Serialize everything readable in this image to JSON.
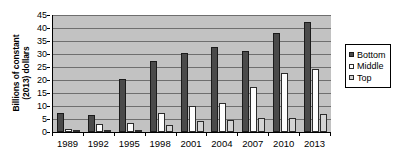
{
  "chart_data": {
    "type": "bar",
    "title": "",
    "subtitle": "",
    "xlabel": "",
    "ylabel": "Billions of constant (2013) dollars",
    "ylabel_lines": [
      "Billions of constant",
      "(2013) dollars"
    ],
    "categories": [
      "1989",
      "1992",
      "1995",
      "1998",
      "2001",
      "2004",
      "2007",
      "2010",
      "2013"
    ],
    "series": [
      {
        "name": "Bottom",
        "color": "#4a4a4a",
        "values": [
          7.0,
          6.2,
          20.2,
          27.2,
          30.1,
          32.4,
          30.8,
          38.0,
          42.0
        ]
      },
      {
        "name": "Middle",
        "color": "#ffffff",
        "values": [
          1.1,
          3.0,
          3.4,
          7.1,
          10.0,
          11.0,
          17.1,
          22.5,
          24.1
        ]
      },
      {
        "name": "Top",
        "color": "#d4d4d4",
        "values": [
          0.2,
          0.2,
          0.2,
          2.4,
          3.9,
          4.3,
          5.2,
          5.3,
          6.9
        ]
      }
    ],
    "ylim": [
      0,
      45
    ],
    "ytick_step": 5,
    "yticks": [
      "0",
      "5",
      "10",
      "15",
      "20",
      "25",
      "30",
      "35",
      "40",
      "45"
    ],
    "grid": true,
    "grid_axis": "y",
    "legend_position": "right",
    "plot_background": "#c2c2c2",
    "grid_color": "#6e6e6e",
    "axis_color": "#000000"
  }
}
